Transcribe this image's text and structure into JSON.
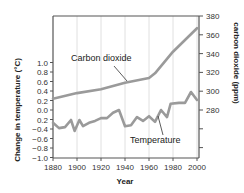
{
  "chart_data": {
    "type": "line",
    "title": "",
    "xlabel": "Year",
    "ylabel": "Change in temperature (°C)",
    "ylabel_right": "carbon dioxide (ppm)",
    "xlim": [
      1880,
      2000
    ],
    "ylim": [
      -1.0,
      1.0
    ],
    "ylim_right": [
      280,
      380
    ],
    "grid": "vertical",
    "legend": "inline annotations",
    "x_ticks": [
      "1880",
      "1900",
      "1920",
      "1940",
      "1960",
      "1980",
      "2000"
    ],
    "y_ticks_left": [
      "1.0",
      "0.8",
      "0.6",
      "0.4",
      "0.2",
      "0.0",
      "0.2",
      "−0.4",
      "−0.6",
      "−0.8",
      "−1.0"
    ],
    "y_ticks_right": [
      "380",
      "360",
      "340",
      "320",
      "300",
      "280"
    ],
    "series": [
      {
        "name": "Carbon dioxide",
        "axis": "right",
        "x": [
          1880,
          1900,
          1920,
          1940,
          1960,
          1965,
          1980,
          2000
        ],
        "values": [
          292,
          298,
          302,
          309,
          314,
          319,
          342,
          367
        ]
      },
      {
        "name": "Temperature",
        "axis": "left",
        "x": [
          1880,
          1885,
          1890,
          1895,
          1898,
          1902,
          1905,
          1910,
          1915,
          1920,
          1925,
          1930,
          1935,
          1940,
          1945,
          1950,
          1955,
          1960,
          1965,
          1970,
          1975,
          1978,
          1985,
          1990,
          1995,
          2000
        ],
        "values": [
          -0.27,
          -0.38,
          -0.36,
          -0.21,
          -0.44,
          -0.21,
          -0.34,
          -0.27,
          -0.23,
          -0.17,
          -0.17,
          -0.06,
          0.0,
          -0.34,
          -0.32,
          -0.15,
          -0.23,
          -0.13,
          -0.25,
          0.0,
          -0.15,
          0.13,
          0.15,
          0.15,
          0.38,
          0.21
        ]
      }
    ],
    "annotations": [
      "Carbon dioxide",
      "Temperature"
    ]
  },
  "labels": {
    "xlabel": "Year",
    "ylabel_left": "Change in temperature (°C)",
    "ylabel_right": "carbon dioxide (ppm)",
    "co2_annotation": "Carbon dioxide",
    "temp_annotation": "Temperature"
  },
  "colors": {
    "line": "#9a9a9a",
    "axis": "#555555",
    "grid": "#d8d8d8"
  }
}
